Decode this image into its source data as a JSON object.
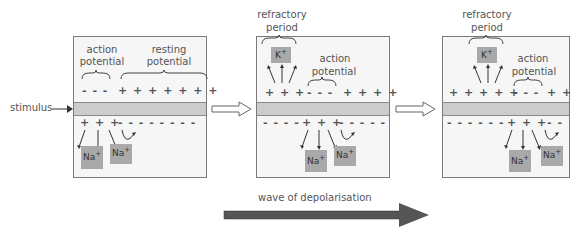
{
  "diagram": {
    "stimulus_label": "stimulus",
    "wave_label": "wave of depolarisation",
    "colors": {
      "panel_bg": "#f6f6f6",
      "membrane": "#cccccc",
      "ion_box": "#a9a9a9",
      "wave_arrow": "#555555",
      "text": "#555555"
    },
    "panels": [
      {
        "id": "panel-1",
        "labels": {
          "action_potential_line1": "action",
          "action_potential_line2": "potential",
          "resting_potential_line1": "resting",
          "resting_potential_line2": "potential"
        },
        "outside_charges": [
          "- - -",
          "+ + + + + + +"
        ],
        "inside_charges": [
          "+ + +",
          "- - - - - - - -"
        ],
        "ions": [
          {
            "symbol": "Na",
            "charge": "+"
          },
          {
            "symbol": "Na",
            "charge": "+"
          }
        ]
      },
      {
        "id": "panel-2",
        "labels": {
          "refractory_line1": "refractory",
          "refractory_line2": "period",
          "action_potential_line1": "action",
          "action_potential_line2": "potential"
        },
        "outside_charges": [
          "+ + +",
          "- - -",
          "+ + + +"
        ],
        "inside_charges": [
          "- - - -",
          "+ + +",
          "- - - - -"
        ],
        "ions": [
          {
            "symbol": "K",
            "charge": "+"
          },
          {
            "symbol": "Na",
            "charge": "+"
          },
          {
            "symbol": "Na",
            "charge": "+"
          }
        ]
      },
      {
        "id": "panel-3",
        "labels": {
          "refractory_line1": "refractory",
          "refractory_line2": "period",
          "action_potential_line1": "action",
          "action_potential_line2": "potential"
        },
        "outside_charges": [
          "+ + + + +",
          "- - -",
          "+ +"
        ],
        "inside_charges": [
          "- - - - - -",
          "+ + +",
          "- -"
        ],
        "ions": [
          {
            "symbol": "K",
            "charge": "+"
          },
          {
            "symbol": "Na",
            "charge": "+"
          },
          {
            "symbol": "Na",
            "charge": "+"
          }
        ]
      }
    ],
    "transition_arrows": [
      "open-arrow",
      "open-arrow"
    ]
  }
}
